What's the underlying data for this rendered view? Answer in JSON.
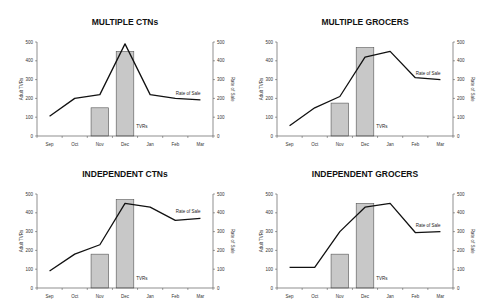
{
  "chart_data": [
    {
      "type": "bar+line",
      "title": "MULTIPLE CTNs",
      "categories": [
        "Sep",
        "Oct",
        "Nov",
        "Dec",
        "Jan",
        "Feb",
        "Mar"
      ],
      "series": [
        {
          "name": "TVRs",
          "type": "bar",
          "axis": "left",
          "values": [
            null,
            null,
            150,
            450,
            null,
            null,
            null
          ]
        },
        {
          "name": "Rate of Sale",
          "type": "line",
          "axis": "right",
          "values": [
            105,
            200,
            220,
            490,
            220,
            200,
            192
          ]
        }
      ],
      "ylabel": "Adult TVRs",
      "ylabel_right": "Rate of Sale",
      "ylim": [
        0,
        500
      ],
      "yticks": [
        0,
        100,
        200,
        300,
        400,
        500
      ],
      "annotations": {
        "tvrs_label": "TVRs",
        "line_label": "Rate of Sale"
      }
    },
    {
      "type": "bar+line",
      "title": "MULTIPLE GROCERS",
      "categories": [
        "Sep",
        "Oct",
        "Nov",
        "Dec",
        "Jan",
        "Feb",
        "Mar"
      ],
      "series": [
        {
          "name": "TVRs",
          "type": "bar",
          "axis": "left",
          "values": [
            null,
            null,
            175,
            470,
            null,
            null,
            null
          ]
        },
        {
          "name": "Rate of Sale",
          "type": "line",
          "axis": "right",
          "values": [
            55,
            150,
            210,
            420,
            450,
            310,
            300
          ]
        }
      ],
      "ylabel": "Adult TVRs",
      "ylabel_right": "Rate of Sale",
      "ylim": [
        0,
        500
      ],
      "yticks": [
        0,
        100,
        200,
        300,
        400,
        500
      ],
      "annotations": {
        "tvrs_label": "TVRs",
        "line_label": "Rate of Sale"
      }
    },
    {
      "type": "bar+line",
      "title": "INDEPENDENT CTNs",
      "categories": [
        "Sep",
        "Oct",
        "Nov",
        "Dec",
        "Jan",
        "Feb",
        "Mar"
      ],
      "series": [
        {
          "name": "TVRs",
          "type": "bar",
          "axis": "left",
          "values": [
            null,
            null,
            180,
            470,
            null,
            null,
            null
          ]
        },
        {
          "name": "Rate of Sale",
          "type": "line",
          "axis": "right",
          "values": [
            90,
            180,
            230,
            450,
            430,
            360,
            370
          ]
        }
      ],
      "ylabel": "Adult TVRs",
      "ylabel_right": "Rate of Sale",
      "ylim": [
        0,
        500
      ],
      "yticks": [
        0,
        100,
        200,
        300,
        400,
        500
      ],
      "annotations": {
        "tvrs_label": "TVRs",
        "line_label": "Rate of Sale"
      }
    },
    {
      "type": "bar+line",
      "title": "INDEPENDENT GROCERS",
      "categories": [
        "Sep",
        "Oct",
        "Nov",
        "Dec",
        "Jan",
        "Feb",
        "Mar"
      ],
      "series": [
        {
          "name": "TVRs",
          "type": "bar",
          "axis": "left",
          "values": [
            null,
            null,
            180,
            450,
            null,
            null,
            null
          ]
        },
        {
          "name": "Rate of Sale",
          "type": "line",
          "axis": "right",
          "values": [
            110,
            110,
            300,
            430,
            450,
            295,
            300
          ]
        }
      ],
      "ylabel": "Adult TVRs",
      "ylabel_right": "Rate of Sale",
      "ylim": [
        0,
        500
      ],
      "yticks": [
        0,
        100,
        200,
        300,
        400,
        500
      ],
      "annotations": {
        "tvrs_label": "TVRs",
        "line_label": "Rate of Sale"
      }
    }
  ],
  "style": {
    "bar_fill": "#c8c8c8",
    "bar_stroke": "#555555",
    "line_color": "#111111",
    "axis_color": "#444444"
  }
}
